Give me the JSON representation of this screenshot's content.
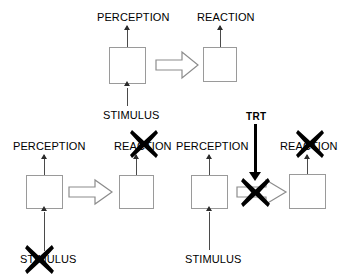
{
  "figure": {
    "colors": {
      "box_stroke": "#9a9a9a",
      "thin_line": "#4a4a4a",
      "arrow_stroke": "#7f7f7f",
      "x_mark": "#000000",
      "text": "#000000",
      "background": "#ffffff"
    }
  },
  "panels": [
    {
      "id": "panel-top",
      "name": "intact-condition",
      "labels": {
        "perception": "PERCEPTION",
        "reaction": "REACTION",
        "stimulus": "STIMULUS"
      },
      "x_marks": []
    },
    {
      "id": "panel-bottom-left",
      "name": "stimulus-blocked-condition",
      "labels": {
        "perception": "PERCEPTION",
        "reaction": "REACTION",
        "stimulus": "STIMULUS"
      },
      "x_marks": [
        "stimulus",
        "reaction"
      ]
    },
    {
      "id": "panel-bottom-right",
      "name": "trt-blocked-condition",
      "labels": {
        "perception": "PERCEPTION",
        "reaction": "REACTION",
        "stimulus": "STIMULUS",
        "trt": "TRT"
      },
      "x_marks": [
        "transfer-arrow",
        "reaction"
      ]
    }
  ]
}
